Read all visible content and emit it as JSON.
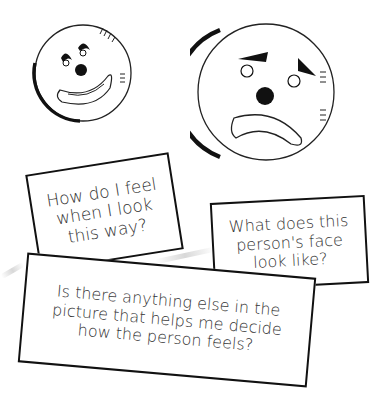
{
  "faces": [
    {
      "name": "happy-clown-face",
      "expression": "happy"
    },
    {
      "name": "sad-clown-face",
      "expression": "sad"
    }
  ],
  "cards": [
    {
      "text": "How do I feel\nwhen I look\nthis way?"
    },
    {
      "text": "What does this\nperson's face\nlook like?"
    },
    {
      "text": "Is there anything else in the\npicture that helps me decide\nhow the person feels?"
    }
  ],
  "colors": {
    "ink": "#111111",
    "text": "#333333",
    "background": "#ffffff"
  }
}
